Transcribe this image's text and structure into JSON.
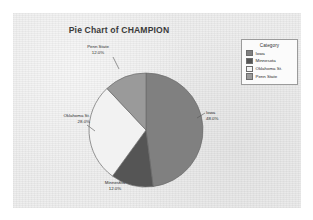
{
  "chart_data": {
    "type": "pie",
    "title": "Pie Chart of CHAMPION",
    "xlabel": "",
    "ylabel": "",
    "legend_position": "top-right",
    "legend_title": "Category",
    "categories": [
      "Iowa",
      "Minnesota",
      "Oklahoma St.",
      "Penn State"
    ],
    "values": [
      48.0,
      12.0,
      28.0,
      12.0
    ],
    "value_unit": "percent",
    "slices": [
      {
        "label": "Iowa",
        "percent_label": "48.0%",
        "value": 48.0,
        "color": "#808080",
        "start_angle_deg": 0,
        "end_angle_deg": 172.8
      },
      {
        "label": "Minnesota",
        "percent_label": "12.0%",
        "value": 12.0,
        "color": "#555555",
        "start_angle_deg": 172.8,
        "end_angle_deg": 216.0
      },
      {
        "label": "Oklahoma St.",
        "percent_label": "28.0%",
        "value": 28.0,
        "color": "#f2f2f2",
        "start_angle_deg": 216.0,
        "end_angle_deg": 316.8
      },
      {
        "label": "Penn State",
        "percent_label": "12.0%",
        "value": 12.0,
        "color": "#9a9a9a",
        "start_angle_deg": 316.8,
        "end_angle_deg": 360.0
      }
    ]
  },
  "legend": {
    "title": "Category",
    "items": [
      {
        "label": "Iowa",
        "color": "#808080"
      },
      {
        "label": "Minnesota",
        "color": "#555555"
      },
      {
        "label": "Oklahoma St.",
        "color": "#f2f2f2"
      },
      {
        "label": "Penn State",
        "color": "#9a9a9a"
      }
    ]
  },
  "labels": {
    "iowa": {
      "name": "Iowa",
      "percent": "48.0%"
    },
    "oklahoma_st": {
      "name": "Oklahoma St.",
      "percent": "28.0%"
    },
    "minnesota": {
      "name": "Minnesota",
      "percent": "12.0%"
    },
    "penn_state": {
      "name": "Penn State",
      "percent": "12.0%"
    }
  },
  "colors": {
    "panel_background": "#ededed",
    "page_background": "#ffffff",
    "slice_outline": "#6b6b6b",
    "legend_border": "#9b9b9b",
    "text": "#2e2e2e"
  }
}
